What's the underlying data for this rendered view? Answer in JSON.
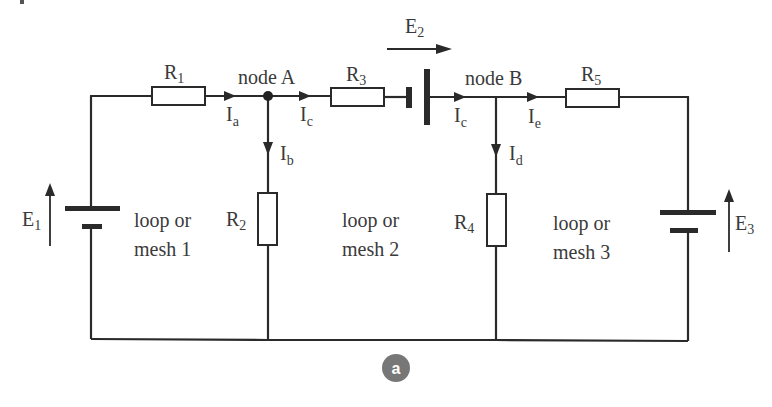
{
  "diagram": {
    "type": "circuit",
    "caption_badge": "a",
    "colors": {
      "wire": "#2a2a2a",
      "text": "#3a3a3a",
      "badge": "#777777",
      "background": "#ffffff"
    },
    "resistors": [
      {
        "id": "R1",
        "label": "R",
        "sub": "1"
      },
      {
        "id": "R2",
        "label": "R",
        "sub": "2"
      },
      {
        "id": "R3",
        "label": "R",
        "sub": "3"
      },
      {
        "id": "R4",
        "label": "R",
        "sub": "4"
      },
      {
        "id": "R5",
        "label": "R",
        "sub": "5"
      }
    ],
    "sources": [
      {
        "id": "E1",
        "label": "E",
        "sub": "1"
      },
      {
        "id": "E2",
        "label": "E",
        "sub": "2"
      },
      {
        "id": "E3",
        "label": "E",
        "sub": "3"
      }
    ],
    "nodes": [
      {
        "id": "A",
        "label": "node A"
      },
      {
        "id": "B",
        "label": "node B"
      }
    ],
    "currents": [
      {
        "id": "Ia",
        "label": "I",
        "sub": "a"
      },
      {
        "id": "Ib",
        "label": "I",
        "sub": "b"
      },
      {
        "id": "Ic1",
        "label": "I",
        "sub": "c"
      },
      {
        "id": "Ic2",
        "label": "I",
        "sub": "c"
      },
      {
        "id": "Id",
        "label": "I",
        "sub": "d"
      },
      {
        "id": "Ie",
        "label": "I",
        "sub": "e"
      }
    ],
    "meshes": [
      {
        "line1": "loop or",
        "line2": "mesh 1"
      },
      {
        "line1": "loop or",
        "line2": "mesh 2"
      },
      {
        "line1": "loop or",
        "line2": "mesh 3"
      }
    ]
  }
}
